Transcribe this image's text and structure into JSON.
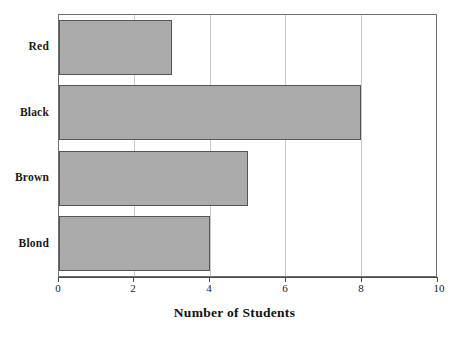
{
  "chart_data": {
    "type": "bar",
    "orientation": "horizontal",
    "title": "",
    "xlabel": "Number of Students",
    "ylabel": "",
    "categories": [
      "Red",
      "Black",
      "Brown",
      "Blond"
    ],
    "values": [
      3,
      8,
      5,
      4
    ],
    "xlim": [
      0,
      10
    ],
    "xticks": [
      0,
      2,
      4,
      6,
      8,
      10
    ],
    "xtick_labels": [
      "0",
      "2",
      "4",
      "6",
      "8",
      "10"
    ],
    "grid": true,
    "grid_axis": "x",
    "legend": false,
    "bar_color": "#ababab",
    "bar_border_color": "#555555",
    "axis_color": "#4a4a4a",
    "grid_color": "#c9c9c9",
    "background": "#ffffff"
  }
}
